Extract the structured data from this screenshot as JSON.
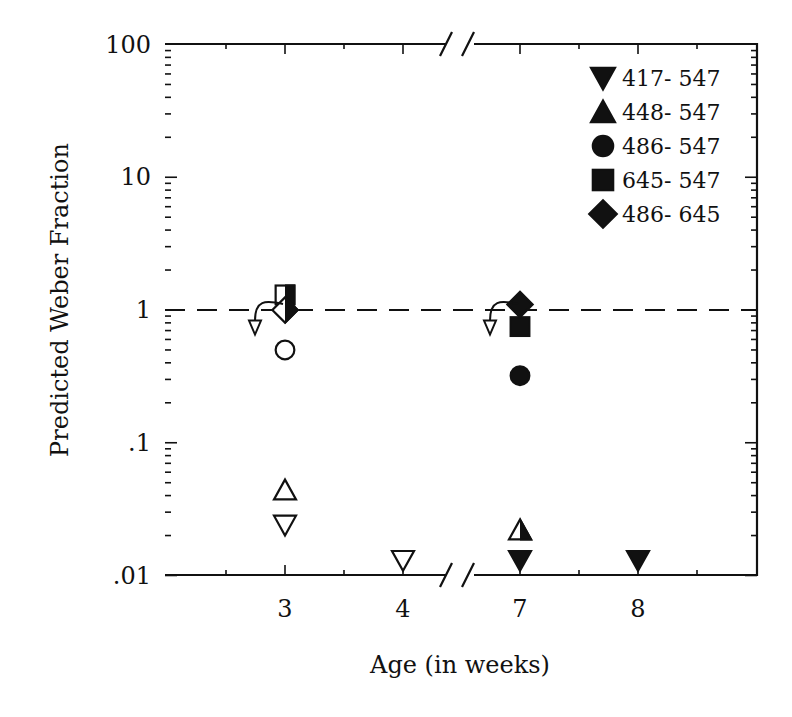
{
  "chart_data": {
    "type": "scatter",
    "title": "",
    "xlabel": "Age (in weeks)",
    "ylabel": "Predicted Weber Fraction",
    "yscale": "log",
    "ylim": [
      0.01,
      100
    ],
    "y_ticks": [
      {
        "value": 100,
        "label": "100"
      },
      {
        "value": 10,
        "label": "10"
      },
      {
        "value": 1,
        "label": "1"
      },
      {
        "value": 0.1,
        "label": ".1"
      },
      {
        "value": 0.01,
        "label": ".01"
      }
    ],
    "x_ticks": [
      "3",
      "4",
      "7",
      "8"
    ],
    "x_axis_break": "between 4 and 7",
    "reference_line": {
      "y": 1,
      "style": "dashed"
    },
    "legend_position": "upper right",
    "legend": [
      {
        "label": "417- 547",
        "marker": "triangle-down"
      },
      {
        "label": "448- 547",
        "marker": "triangle-up"
      },
      {
        "label": "486- 547",
        "marker": "circle"
      },
      {
        "label": "645- 547",
        "marker": "square"
      },
      {
        "label": "486- 645",
        "marker": "diamond"
      }
    ],
    "series": [
      {
        "name": "417- 547",
        "points": [
          {
            "x": "3",
            "y": 0.024,
            "fill": "open"
          },
          {
            "x": "4",
            "y": 0.013,
            "fill": "open"
          },
          {
            "x": "7",
            "y": 0.013,
            "fill": "filled"
          },
          {
            "x": "8",
            "y": 0.013,
            "fill": "filled"
          }
        ]
      },
      {
        "name": "448- 547",
        "points": [
          {
            "x": "3",
            "y": 0.044,
            "fill": "open"
          },
          {
            "x": "7",
            "y": 0.022,
            "fill": "half"
          }
        ]
      },
      {
        "name": "486- 547",
        "points": [
          {
            "x": "3",
            "y": 0.5,
            "fill": "open"
          },
          {
            "x": "7",
            "y": 0.32,
            "fill": "filled"
          }
        ]
      },
      {
        "name": "645- 547",
        "points": [
          {
            "x": "3",
            "y": 1.3,
            "fill": "half"
          },
          {
            "x": "7",
            "y": 0.75,
            "fill": "filled"
          }
        ]
      },
      {
        "name": "486- 645",
        "points": [
          {
            "x": "3",
            "y": 1.0,
            "fill": "half"
          },
          {
            "x": "7",
            "y": 1.1,
            "fill": "filled"
          }
        ]
      }
    ],
    "arrows": [
      {
        "x": "3",
        "from_y": 1.0,
        "to_y": 0.7
      },
      {
        "x": "7",
        "from_y": 1.0,
        "to_y": 0.7
      }
    ]
  }
}
